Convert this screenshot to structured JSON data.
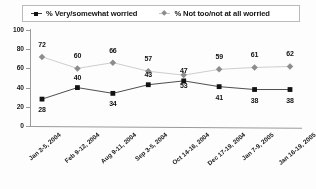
{
  "legend": {
    "items": [
      {
        "label": "% Very/somewhat worried",
        "marker": "square-marker-icon",
        "color": "#141414"
      },
      {
        "label": "% Not too/not at all worried",
        "marker": "diamond-marker-icon",
        "color": "#8d8d8d"
      }
    ]
  },
  "axis": {
    "y_ticks": [
      "100",
      "80",
      "60",
      "40",
      "20",
      "0"
    ]
  },
  "chart_data": {
    "type": "line",
    "title": "",
    "xlabel": "",
    "ylabel": "",
    "ylim": [
      0,
      100
    ],
    "ytick_step": 20,
    "grid": false,
    "legend_position": "top",
    "categories": [
      "Jan 2-5, 2004",
      "Feb 9-12, 2004",
      "Aug 9-11, 2004",
      "Sep 3-5, 2004",
      "Oct 14-16, 2004",
      "Dec 17-19, 2004",
      "Jan 7-9, 2005",
      "Jan 16-19, 2005"
    ],
    "series": [
      {
        "name": "% Very/somewhat worried",
        "color": "#141414",
        "marker": "square",
        "values": [
          28,
          40,
          34,
          43,
          47,
          41,
          38,
          38
        ]
      },
      {
        "name": "% Not too/not at all worried",
        "color": "#8d8d8d",
        "marker": "diamond",
        "values": [
          72,
          60,
          66,
          57,
          53,
          59,
          61,
          62
        ]
      }
    ]
  }
}
